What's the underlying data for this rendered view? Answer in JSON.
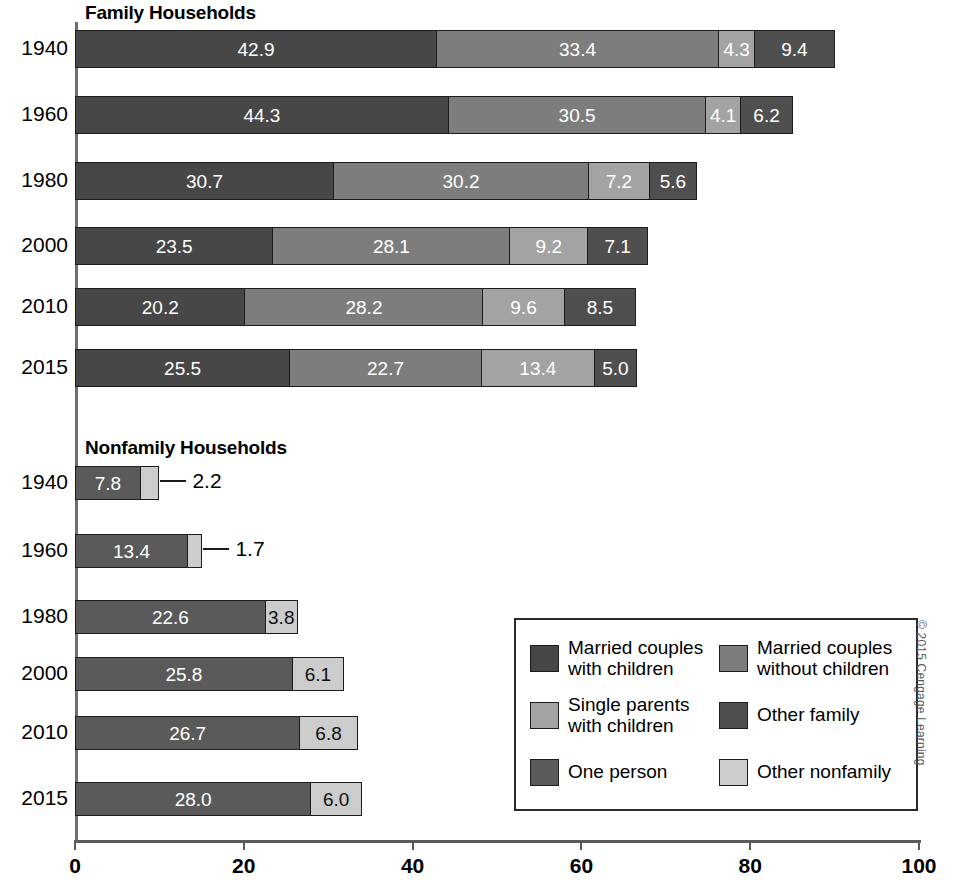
{
  "chart_data": {
    "type": "bar",
    "subtype": "stacked-horizontal",
    "title": "",
    "xlabel": "",
    "ylabel": "",
    "xlim": [
      0,
      100
    ],
    "xticks": [
      0,
      20,
      40,
      60,
      80,
      100
    ],
    "grid": false,
    "legend_position": "inside-bottom-right",
    "panels": [
      {
        "name": "family",
        "title": "Family Households",
        "categories": [
          "1940",
          "1960",
          "1980",
          "2000",
          "2010",
          "2015"
        ],
        "series": [
          {
            "name": "Married couples with children",
            "color": "#474747",
            "values": [
              42.9,
              44.3,
              30.7,
              23.5,
              20.2,
              25.5
            ]
          },
          {
            "name": "Married couples without children",
            "color": "#7d7d7d",
            "values": [
              33.4,
              30.5,
              30.2,
              28.1,
              28.2,
              22.7
            ]
          },
          {
            "name": "Single parents with children",
            "color": "#a3a3a3",
            "values": [
              4.3,
              4.1,
              7.2,
              9.2,
              9.6,
              13.4
            ]
          },
          {
            "name": "Other family",
            "color": "#4f4f4f",
            "values": [
              9.4,
              6.2,
              5.6,
              7.1,
              8.5,
              5.0
            ]
          }
        ],
        "totals": [
          90.0,
          85.1,
          73.7,
          67.9,
          66.5,
          66.6
        ]
      },
      {
        "name": "nonfamily",
        "title": "Nonfamily Households",
        "categories": [
          "1940",
          "1960",
          "1980",
          "2000",
          "2010",
          "2015"
        ],
        "series": [
          {
            "name": "One person",
            "color": "#5a5a5a",
            "values": [
              7.8,
              13.4,
              22.6,
              25.8,
              26.7,
              28.0
            ]
          },
          {
            "name": "Other nonfamily",
            "color": "#cccccc",
            "values": [
              2.2,
              1.7,
              3.8,
              6.1,
              6.8,
              6.0
            ]
          }
        ],
        "totals": [
          10.0,
          15.1,
          26.4,
          31.9,
          33.5,
          34.0
        ],
        "callout_rows": [
          "1940",
          "1960"
        ]
      }
    ]
  },
  "panels": {
    "family": {
      "title": "Family Households",
      "rows": [
        {
          "year": "1940",
          "segments": [
            {
              "key": "married-with-children",
              "value": "42.9",
              "num": 42.9,
              "color": "#474747",
              "label_color": "light",
              "label_mode": "inside"
            },
            {
              "key": "married-without-children",
              "value": "33.4",
              "num": 33.4,
              "color": "#7d7d7d",
              "label_color": "light",
              "label_mode": "inside"
            },
            {
              "key": "single-parents",
              "value": "4.3",
              "num": 4.3,
              "color": "#a3a3a3",
              "label_color": "light",
              "label_mode": "inside"
            },
            {
              "key": "other-family",
              "value": "9.4",
              "num": 9.4,
              "color": "#4f4f4f",
              "label_color": "light",
              "label_mode": "inside"
            }
          ]
        },
        {
          "year": "1960",
          "segments": [
            {
              "key": "married-with-children",
              "value": "44.3",
              "num": 44.3,
              "color": "#474747",
              "label_color": "light",
              "label_mode": "inside"
            },
            {
              "key": "married-without-children",
              "value": "30.5",
              "num": 30.5,
              "color": "#7d7d7d",
              "label_color": "light",
              "label_mode": "inside"
            },
            {
              "key": "single-parents",
              "value": "4.1",
              "num": 4.1,
              "color": "#a3a3a3",
              "label_color": "light",
              "label_mode": "inside"
            },
            {
              "key": "other-family",
              "value": "6.2",
              "num": 6.2,
              "color": "#4f4f4f",
              "label_color": "light",
              "label_mode": "inside"
            }
          ]
        },
        {
          "year": "1980",
          "segments": [
            {
              "key": "married-with-children",
              "value": "30.7",
              "num": 30.7,
              "color": "#474747",
              "label_color": "light",
              "label_mode": "inside"
            },
            {
              "key": "married-without-children",
              "value": "30.2",
              "num": 30.2,
              "color": "#7d7d7d",
              "label_color": "light",
              "label_mode": "inside"
            },
            {
              "key": "single-parents",
              "value": "7.2",
              "num": 7.2,
              "color": "#a3a3a3",
              "label_color": "light",
              "label_mode": "inside"
            },
            {
              "key": "other-family",
              "value": "5.6",
              "num": 5.6,
              "color": "#4f4f4f",
              "label_color": "light",
              "label_mode": "inside"
            }
          ]
        },
        {
          "year": "2000",
          "segments": [
            {
              "key": "married-with-children",
              "value": "23.5",
              "num": 23.5,
              "color": "#474747",
              "label_color": "light",
              "label_mode": "inside"
            },
            {
              "key": "married-without-children",
              "value": "28.1",
              "num": 28.1,
              "color": "#7d7d7d",
              "label_color": "light",
              "label_mode": "inside"
            },
            {
              "key": "single-parents",
              "value": "9.2",
              "num": 9.2,
              "color": "#a3a3a3",
              "label_color": "light",
              "label_mode": "inside"
            },
            {
              "key": "other-family",
              "value": "7.1",
              "num": 7.1,
              "color": "#4f4f4f",
              "label_color": "light",
              "label_mode": "inside"
            }
          ]
        },
        {
          "year": "2010",
          "segments": [
            {
              "key": "married-with-children",
              "value": "20.2",
              "num": 20.2,
              "color": "#474747",
              "label_color": "light",
              "label_mode": "inside"
            },
            {
              "key": "married-without-children",
              "value": "28.2",
              "num": 28.2,
              "color": "#7d7d7d",
              "label_color": "light",
              "label_mode": "inside"
            },
            {
              "key": "single-parents",
              "value": "9.6",
              "num": 9.6,
              "color": "#a3a3a3",
              "label_color": "light",
              "label_mode": "inside"
            },
            {
              "key": "other-family",
              "value": "8.5",
              "num": 8.5,
              "color": "#4f4f4f",
              "label_color": "light",
              "label_mode": "inside"
            }
          ]
        },
        {
          "year": "2015",
          "segments": [
            {
              "key": "married-with-children",
              "value": "25.5",
              "num": 25.5,
              "color": "#474747",
              "label_color": "light",
              "label_mode": "inside"
            },
            {
              "key": "married-without-children",
              "value": "22.7",
              "num": 22.7,
              "color": "#7d7d7d",
              "label_color": "light",
              "label_mode": "inside"
            },
            {
              "key": "single-parents",
              "value": "13.4",
              "num": 13.4,
              "color": "#a3a3a3",
              "label_color": "light",
              "label_mode": "inside"
            },
            {
              "key": "other-family",
              "value": "5.0",
              "num": 5.0,
              "color": "#4f4f4f",
              "label_color": "light",
              "label_mode": "inside"
            }
          ]
        }
      ]
    },
    "nonfamily": {
      "title": "Nonfamily Households",
      "rows": [
        {
          "year": "1940",
          "segments": [
            {
              "key": "one-person",
              "value": "7.8",
              "num": 7.8,
              "color": "#5a5a5a",
              "label_color": "light",
              "label_mode": "inside"
            },
            {
              "key": "other-nonfamily",
              "value": "2.2",
              "num": 2.2,
              "color": "#cccccc",
              "label_color": "dark",
              "label_mode": "callout"
            }
          ]
        },
        {
          "year": "1960",
          "segments": [
            {
              "key": "one-person",
              "value": "13.4",
              "num": 13.4,
              "color": "#5a5a5a",
              "label_color": "light",
              "label_mode": "inside"
            },
            {
              "key": "other-nonfamily",
              "value": "1.7",
              "num": 1.7,
              "color": "#cccccc",
              "label_color": "dark",
              "label_mode": "callout"
            }
          ]
        },
        {
          "year": "1980",
          "segments": [
            {
              "key": "one-person",
              "value": "22.6",
              "num": 22.6,
              "color": "#5a5a5a",
              "label_color": "light",
              "label_mode": "inside"
            },
            {
              "key": "other-nonfamily",
              "value": "3.8",
              "num": 3.8,
              "color": "#cccccc",
              "label_color": "dark",
              "label_mode": "inside"
            }
          ]
        },
        {
          "year": "2000",
          "segments": [
            {
              "key": "one-person",
              "value": "25.8",
              "num": 25.8,
              "color": "#5a5a5a",
              "label_color": "light",
              "label_mode": "inside"
            },
            {
              "key": "other-nonfamily",
              "value": "6.1",
              "num": 6.1,
              "color": "#cccccc",
              "label_color": "dark",
              "label_mode": "inside"
            }
          ]
        },
        {
          "year": "2010",
          "segments": [
            {
              "key": "one-person",
              "value": "26.7",
              "num": 26.7,
              "color": "#5a5a5a",
              "label_color": "light",
              "label_mode": "inside"
            },
            {
              "key": "other-nonfamily",
              "value": "6.8",
              "num": 6.8,
              "color": "#cccccc",
              "label_color": "dark",
              "label_mode": "inside"
            }
          ]
        },
        {
          "year": "2015",
          "segments": [
            {
              "key": "one-person",
              "value": "28.0",
              "num": 28.0,
              "color": "#5a5a5a",
              "label_color": "light",
              "label_mode": "inside"
            },
            {
              "key": "other-nonfamily",
              "value": "6.0",
              "num": 6.0,
              "color": "#cccccc",
              "label_color": "dark",
              "label_mode": "inside"
            }
          ]
        }
      ]
    }
  },
  "axis": {
    "ticks": [
      "0",
      "20",
      "40",
      "60",
      "80",
      "100"
    ],
    "tick_values": [
      0,
      20,
      40,
      60,
      80,
      100
    ]
  },
  "legend": {
    "items": [
      {
        "key": "married-with-children",
        "label": "Married couples\nwith children",
        "color": "#474747"
      },
      {
        "key": "married-without-children",
        "label": "Married couples\nwithout children",
        "color": "#7d7d7d"
      },
      {
        "key": "single-parents",
        "label": "Single parents\nwith children",
        "color": "#a3a3a3"
      },
      {
        "key": "other-family",
        "label": "Other family",
        "color": "#4f4f4f"
      },
      {
        "key": "one-person",
        "label": "One person",
        "color": "#5a5a5a"
      },
      {
        "key": "other-nonfamily",
        "label": "Other nonfamily",
        "color": "#cccccc"
      }
    ]
  },
  "copyright": "© 2015 Cengage Learning"
}
